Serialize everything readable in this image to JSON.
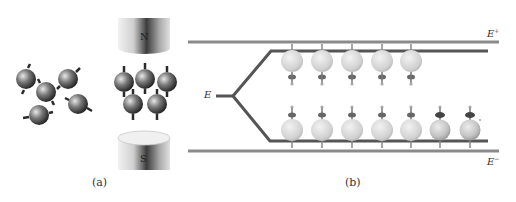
{
  "figure": {
    "panel_a": {
      "caption": "(a)",
      "magnet_north_label": "N",
      "magnet_south_label": "S",
      "random_spins_count": 5,
      "aligned_spins_count": 5
    },
    "panel_b": {
      "caption": "(b)",
      "input_label": "E",
      "upper_plate_label": "E",
      "upper_plate_sup": "+",
      "lower_plate_label": "E",
      "lower_plate_sup": "−",
      "upper_branch_spins": 5,
      "lower_branch_spins": 7
    },
    "colors": {
      "line": "#707070",
      "branch": "#555555",
      "sphere_light": "#d8d8d8",
      "sphere_dark": "#4a4a4a"
    }
  }
}
